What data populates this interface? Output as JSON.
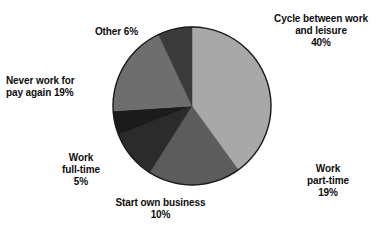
{
  "chart_data": {
    "type": "pie",
    "title": "",
    "subtitle": "",
    "xlabel": "",
    "ylabel": "",
    "legend_position": "none",
    "grid": false,
    "labels_placement": "outside-callout",
    "unit": "%",
    "start_angle_deg": 0,
    "direction": "clockwise",
    "center": {
      "x": 192,
      "y": 106,
      "radius": 79
    },
    "categories": [
      "Cycle between work and leisure",
      "Work part-time",
      "Start own business",
      "Work full-time",
      "Never work for pay again",
      "Other"
    ],
    "values": [
      40,
      19,
      10,
      5,
      19,
      6
    ],
    "colors": [
      "#a8a8a8",
      "#5c5c5c",
      "#2b2b2b",
      "#1b1b1b",
      "#6e6e6e",
      "#3a3a3a"
    ],
    "slices": [
      {
        "name": "cycle-between-work-and-leisure",
        "label": "Cycle between work\nand leisure\n40%",
        "label_text": "Cycle between work and leisure",
        "value": 40,
        "value_label": "40%",
        "color": "#a8a8a8",
        "start_deg": 0,
        "end_deg": 144
      },
      {
        "name": "work-part-time",
        "label": "Work\npart-time\n19%",
        "label_text": "Work part-time",
        "value": 19,
        "value_label": "19%",
        "color": "#5c5c5c",
        "start_deg": 144,
        "end_deg": 212.4
      },
      {
        "name": "start-own-business",
        "label": "Start own business\n10%",
        "label_text": "Start own business",
        "value": 10,
        "value_label": "10%",
        "color": "#2b2b2b",
        "start_deg": 212.4,
        "end_deg": 248.4
      },
      {
        "name": "work-full-time",
        "label": "Work\nfull-time\n5%",
        "label_text": "Work full-time",
        "value": 5,
        "value_label": "5%",
        "color": "#1b1b1b",
        "start_deg": 248.4,
        "end_deg": 266.4
      },
      {
        "name": "never-work-for-pay-again",
        "label": "Never work for\npay again 19%",
        "label_text": "Never work for pay again",
        "value": 19,
        "value_label": "19%",
        "color": "#6e6e6e",
        "start_deg": 266.4,
        "end_deg": 334.8
      },
      {
        "name": "other",
        "label": "Other 6%",
        "label_text": "Other",
        "value": 6,
        "value_label": "6%",
        "color": "#3a3a3a",
        "start_deg": 334.8,
        "end_deg": 360
      }
    ]
  },
  "style": {
    "background": "#ffffff",
    "outline": "#1a1a1a",
    "text_color": "#0d0d0d"
  }
}
